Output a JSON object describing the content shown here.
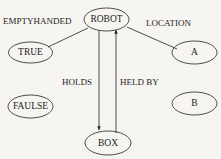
{
  "diagram": {
    "type": "semantic-network",
    "background_color": "#f7f5f1",
    "stroke_color": "#3a3a3a",
    "text_color": "#1c1c1c",
    "canvas": {
      "width": 221,
      "height": 159
    },
    "nodes": [
      {
        "id": "robot",
        "label": "ROBOT",
        "cx": 106.5,
        "cy": 19.5,
        "rx": 22.5,
        "ry": 11.5,
        "font_size": 9.5
      },
      {
        "id": "true",
        "label": "TRUE",
        "cx": 30.5,
        "cy": 52.5,
        "rx": 22.0,
        "ry": 10.5,
        "font_size": 9.5
      },
      {
        "id": "faulse",
        "label": "FAULSE",
        "cx": 30.5,
        "cy": 106.5,
        "rx": 22.5,
        "ry": 11.5,
        "font_size": 9.5
      },
      {
        "id": "a",
        "label": "A",
        "cx": 194.5,
        "cy": 52.5,
        "rx": 22.5,
        "ry": 11.5,
        "font_size": 9.5
      },
      {
        "id": "b",
        "label": "B",
        "cx": 194.5,
        "cy": 103.5,
        "rx": 22.5,
        "ry": 11.5,
        "font_size": 9.5
      },
      {
        "id": "box",
        "label": "BOX",
        "cx": 108.0,
        "cy": 143.0,
        "rx": 23.0,
        "ry": 12.0,
        "font_size": 9.5
      }
    ],
    "edges": [
      {
        "id": "emptyhanded",
        "label": "EMPTYHANDED",
        "from": "robot",
        "to": "true",
        "arrow": "none",
        "x1": 88,
        "y1": 28,
        "x2": 48,
        "y2": 47,
        "label_x": 3,
        "label_y": 22,
        "label_anchor": "start",
        "font_size": 9.0
      },
      {
        "id": "location",
        "label": "LOCATION",
        "from": "robot",
        "to": "a",
        "arrow": "none",
        "x1": 127,
        "y1": 27,
        "x2": 177,
        "y2": 49,
        "label_x": 146,
        "label_y": 24,
        "label_anchor": "start",
        "font_size": 9.0
      },
      {
        "id": "holds",
        "label": "HOLDS",
        "from": "robot",
        "to": "box",
        "arrow": "end",
        "x1": 99,
        "y1": 30,
        "x2": 99,
        "y2": 130,
        "label_x": 62,
        "label_y": 83,
        "label_anchor": "start",
        "font_size": 9.0
      },
      {
        "id": "held-by",
        "label": "HELD BY",
        "from": "box",
        "to": "robot",
        "arrow": "end",
        "x1": 116,
        "y1": 133,
        "x2": 116,
        "y2": 30,
        "label_x": 120,
        "label_y": 83,
        "label_anchor": "start",
        "font_size": 9.0
      }
    ]
  }
}
